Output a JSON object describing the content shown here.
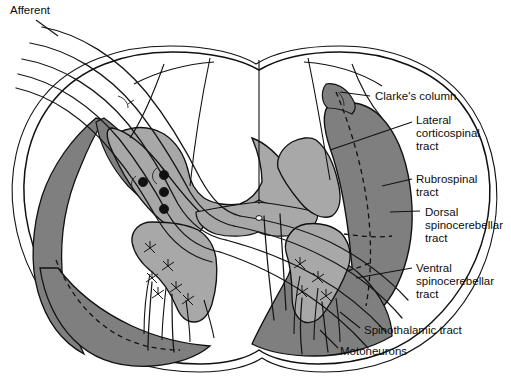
{
  "figure": {
    "background_color": "#ffffff",
    "ink_color": "#111111",
    "tract_gray": "#7f7f7f",
    "central_gray": "#a8a8a8",
    "white_matter": "#ffffff"
  },
  "labels": {
    "afferent": {
      "text": "Afferent",
      "x": 10,
      "y": 14,
      "anchor": "start"
    },
    "clarkes_column": {
      "text": "Clarke's column",
      "x": 375,
      "y": 100,
      "anchor": "start"
    },
    "lateral_corticospinal_tract": {
      "lines": [
        "Lateral",
        "corticospinal",
        "tract"
      ],
      "x": 416,
      "y": 128,
      "anchor": "start"
    },
    "rubrospinal_tract": {
      "lines": [
        "Rubrospinal",
        "tract"
      ],
      "x": 416,
      "y": 182,
      "anchor": "start"
    },
    "dorsal_spinocerebellar_tract": {
      "lines": [
        "Dorsal",
        "spinocerebellar",
        "tract"
      ],
      "x": 425,
      "y": 219,
      "anchor": "start"
    },
    "ventral_spinocerebellar_tract": {
      "lines": [
        "Ventral",
        "spinocerebellar",
        "tract"
      ],
      "x": 416,
      "y": 272,
      "anchor": "start"
    },
    "spinothalamic_tract": {
      "text": "Spinothalamic tract",
      "x": 364,
      "y": 332,
      "anchor": "start"
    },
    "motoneurons": {
      "text": "Motoneurons",
      "x": 340,
      "y": 353,
      "anchor": "start"
    }
  },
  "structures": {
    "cord_outline": "spinal-cord-outline",
    "dorsal_columns": "dorsal-column-white-matter",
    "gray_matter": "butterfly-gray-matter",
    "dorsal_horn": "dorsal-horn",
    "ventral_horn": "ventral-horn",
    "central_canal": "central-canal",
    "afferent_fiber_count": 5,
    "clarke_cell_count": 4,
    "motoneuron_star_count": 10
  }
}
